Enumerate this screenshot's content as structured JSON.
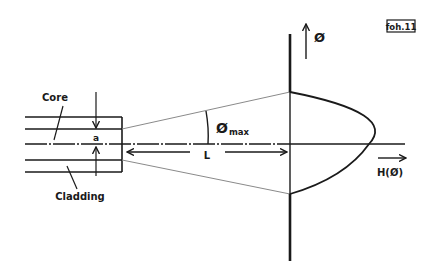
{
  "figure": {
    "tag": "foh.11",
    "labels": {
      "core": "Core",
      "cladding": "Cladding",
      "core_radius": "a",
      "distance": "L",
      "angle_symbol": "Ø",
      "angle_subscript": "max",
      "vertical_axis": "Ø",
      "horizontal_axis": "H(Ø)"
    },
    "colors": {
      "ink": "#1a1a1a",
      "cone": "#8a8a8a",
      "background": "#ffffff"
    }
  }
}
